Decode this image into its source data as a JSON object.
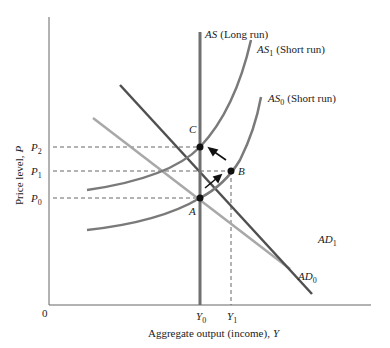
{
  "diagram": {
    "title": "",
    "axes": {
      "x_label": "Aggregate output (income),",
      "x_var": "Y",
      "y_label": "Price level,",
      "y_var": "P",
      "origin": "0"
    },
    "curves": {
      "as_long": {
        "name": "AS",
        "note": "(Long run)"
      },
      "as1": {
        "name": "AS",
        "sub": "1",
        "note": "(Short run)"
      },
      "as0": {
        "name": "AS",
        "sub": "0",
        "note": "(Short run)"
      },
      "ad1": {
        "name": "AD",
        "sub": "1"
      },
      "ad0": {
        "name": "AD",
        "sub": "0"
      }
    },
    "points": {
      "a": "A",
      "b": "B",
      "c": "C"
    },
    "price_ticks": [
      {
        "name": "P",
        "sub": "2"
      },
      {
        "name": "P",
        "sub": "1"
      },
      {
        "name": "P",
        "sub": "0"
      }
    ],
    "output_ticks": [
      {
        "name": "Y",
        "sub": "0"
      },
      {
        "name": "Y",
        "sub": "1"
      }
    ],
    "colors": {
      "axis": "#555555",
      "as_long": "#707070",
      "as_short": "#7a7a7a",
      "ad1": "#505050",
      "ad0": "#a8a8a8",
      "points": "#111111"
    }
  }
}
